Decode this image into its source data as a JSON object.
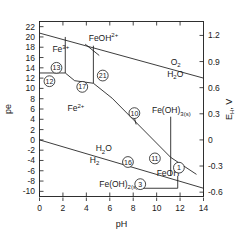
{
  "chart_data": {
    "type": "line",
    "title": "",
    "xlabel": "pH",
    "ylabel": "pe",
    "ylabel_right": "E H , V",
    "xlim": [
      0,
      14
    ],
    "ylim": [
      -11,
      23
    ],
    "ylim_right": [
      -0.65,
      1.36
    ],
    "grid": false,
    "legend": "none",
    "xticks": [
      0,
      2,
      4,
      6,
      8,
      10,
      12,
      14
    ],
    "yticks": [
      22,
      20,
      18,
      16,
      14,
      12,
      10,
      8,
      6,
      4,
      2,
      0,
      -2,
      -4,
      -6,
      -8,
      -10
    ],
    "yticks_right": [
      1.2,
      0.9,
      0.6,
      0.3,
      0,
      -0.3,
      -0.6
    ],
    "xtick_labels": [
      "0",
      "2",
      "4",
      "6",
      "8",
      "10",
      "12",
      "14"
    ],
    "ytick_labels": [
      "22",
      "20",
      "18",
      "16",
      "14",
      "12",
      "10",
      "8",
      "6",
      "4",
      "2",
      "0",
      "-2",
      "-4",
      "-6",
      "-8",
      "-10"
    ],
    "ytick_right_labels": [
      "1.2",
      "0.9",
      "0.6",
      "0.3",
      "0",
      "-0.3",
      "-0.6"
    ],
    "species_labels": [
      {
        "id": "fe3",
        "base": "Fe",
        "sup": "3+",
        "sub": "",
        "x": 1.1,
        "y": 17.0
      },
      {
        "id": "feoh2",
        "base": "FeOH",
        "sup": "2+",
        "sub": "",
        "x": 4.2,
        "y": 19.3
      },
      {
        "id": "o2",
        "base": "O",
        "sup": "",
        "sub": "2",
        "x": 11.2,
        "y": 14.6
      },
      {
        "id": "h2o_top",
        "base": "H",
        "sup": "",
        "sub": "2",
        "sub2": "O",
        "x": 10.9,
        "y": 12.3
      },
      {
        "id": "fe2",
        "base": "Fe",
        "sup": "2+",
        "sub": "",
        "x": 2.4,
        "y": 5.6
      },
      {
        "id": "feoh3s",
        "base": "Fe(OH)",
        "sup": "",
        "sub": "3(s)",
        "x": 9.6,
        "y": 5.2
      },
      {
        "id": "h2o_bot",
        "base": "H",
        "sup": "",
        "sub": "2",
        "sub2": "O",
        "x": 4.8,
        "y": -2.2
      },
      {
        "id": "h2",
        "base": "H",
        "sup": "",
        "sub": "2",
        "x": 4.3,
        "y": -4.4
      },
      {
        "id": "feohp",
        "base": "FeOH",
        "sup": "+",
        "sub": "",
        "x": 10.0,
        "y": -7.0
      },
      {
        "id": "feoh2s",
        "base": "Fe(OH)",
        "sup": "",
        "sub": "2(s)",
        "x": 5.1,
        "y": -9.1
      }
    ],
    "circled_numbers": [
      {
        "label": "13",
        "x": 1.45,
        "y": 14.0
      },
      {
        "label": "12",
        "x": 0.85,
        "y": 11.4
      },
      {
        "label": "17",
        "x": 3.65,
        "y": 10.3
      },
      {
        "label": "21",
        "x": 5.4,
        "y": 12.5
      },
      {
        "label": "10",
        "x": 8.1,
        "y": 5.2
      },
      {
        "label": "16",
        "x": 7.55,
        "y": -4.3
      },
      {
        "label": "11",
        "x": 9.85,
        "y": -3.6
      },
      {
        "label": "1",
        "x": 11.9,
        "y": -5.4
      },
      {
        "label": "3",
        "x": 8.6,
        "y": -8.6
      }
    ],
    "boundaries": [
      {
        "name": "o2-h2o-upper",
        "points": [
          [
            0,
            20.75
          ],
          [
            14,
            12.0
          ]
        ]
      },
      {
        "name": "h2o-h2-lower",
        "points": [
          [
            0,
            0.0
          ],
          [
            14,
            -9.4
          ]
        ]
      },
      {
        "name": "fe3-fe2-horiz",
        "points": [
          [
            0,
            13.0
          ],
          [
            2.2,
            13.0
          ]
        ]
      },
      {
        "name": "fe3-feoh2-vert",
        "points": [
          [
            2.2,
            20.0
          ],
          [
            2.2,
            13.0
          ]
        ]
      },
      {
        "name": "fe2-feoh2-seg",
        "points": [
          [
            2.2,
            13.0
          ],
          [
            3.0,
            11.5
          ]
        ]
      },
      {
        "name": "feoh2-vert",
        "points": [
          [
            4.6,
            18.3
          ],
          [
            4.6,
            11.0
          ]
        ]
      },
      {
        "name": "seg-21",
        "points": [
          [
            3.0,
            11.5
          ],
          [
            4.6,
            11.0
          ]
        ]
      },
      {
        "name": "feoh2-feoh3",
        "points": [
          [
            4.6,
            11.0
          ],
          [
            6.2,
            8.1
          ]
        ]
      },
      {
        "name": "fe2-feoh3",
        "points": [
          [
            6.2,
            8.1
          ],
          [
            11.2,
            -3.4
          ]
        ]
      },
      {
        "name": "feoh3-vert",
        "points": [
          [
            11.2,
            4.5
          ],
          [
            11.2,
            -7.0
          ]
        ]
      },
      {
        "name": "feoh3-feohp",
        "points": [
          [
            11.2,
            -3.4
          ],
          [
            13.4,
            -6.7
          ]
        ]
      },
      {
        "name": "feoh2s-horiz",
        "points": [
          [
            8.6,
            -9.4
          ],
          [
            11.8,
            -9.4
          ]
        ]
      },
      {
        "name": "feoh2s-vert",
        "points": [
          [
            11.8,
            -7.0
          ],
          [
            11.8,
            -9.4
          ]
        ]
      },
      {
        "name": "pointer-feoh2",
        "points": [
          [
            3.9,
            18.6
          ],
          [
            5.1,
            16.4
          ]
        ]
      },
      {
        "name": "pointer-10",
        "points": [
          [
            8.1,
            4.3
          ],
          [
            8.25,
            3.0
          ]
        ]
      }
    ]
  }
}
